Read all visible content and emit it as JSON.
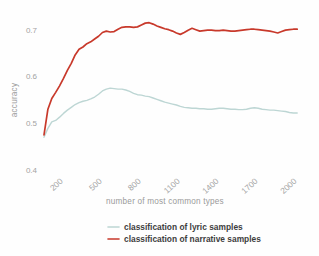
{
  "chart_data": {
    "type": "line",
    "title": "",
    "subtitle": "",
    "xlabel": "number of most common types",
    "ylabel": "accuracy",
    "xlim": [
      50,
      2060
    ],
    "ylim": [
      0.4,
      0.725
    ],
    "grid": false,
    "legend_position": "bottom",
    "xticks": [
      200,
      500,
      800,
      1100,
      1400,
      1700,
      2000
    ],
    "xtick_labels": [
      "200",
      "500",
      "800",
      "1100",
      "1400",
      "1700",
      "2000"
    ],
    "yticks": [
      0.4,
      0.5,
      0.6,
      0.7
    ],
    "ytick_labels": [
      "0.4",
      "0.5",
      "0.6",
      "0.7"
    ],
    "x": [
      50,
      80,
      110,
      140,
      170,
      200,
      230,
      260,
      290,
      320,
      350,
      380,
      410,
      440,
      470,
      500,
      530,
      560,
      590,
      620,
      650,
      680,
      710,
      740,
      770,
      800,
      830,
      860,
      890,
      920,
      950,
      980,
      1010,
      1040,
      1070,
      1100,
      1130,
      1160,
      1190,
      1220,
      1250,
      1280,
      1310,
      1340,
      1370,
      1400,
      1430,
      1460,
      1490,
      1520,
      1550,
      1580,
      1610,
      1640,
      1670,
      1700,
      1730,
      1760,
      1790,
      1820,
      1850,
      1880,
      1910,
      1940,
      1970,
      2000
    ],
    "series": [
      {
        "name": "classification of lyric samples",
        "color": "#bdd6d4",
        "values": [
          0.47,
          0.489,
          0.503,
          0.506,
          0.513,
          0.521,
          0.528,
          0.534,
          0.54,
          0.544,
          0.547,
          0.549,
          0.552,
          0.556,
          0.562,
          0.569,
          0.573,
          0.575,
          0.574,
          0.573,
          0.573,
          0.571,
          0.568,
          0.564,
          0.561,
          0.56,
          0.558,
          0.557,
          0.554,
          0.551,
          0.548,
          0.545,
          0.543,
          0.541,
          0.539,
          0.536,
          0.534,
          0.533,
          0.532,
          0.532,
          0.531,
          0.531,
          0.53,
          0.53,
          0.531,
          0.532,
          0.532,
          0.531,
          0.53,
          0.53,
          0.529,
          0.529,
          0.53,
          0.532,
          0.533,
          0.532,
          0.53,
          0.529,
          0.528,
          0.528,
          0.527,
          0.526,
          0.525,
          0.523,
          0.522,
          0.522
        ]
      },
      {
        "name": "classification of narrative samples",
        "color": "#c8392b",
        "values": [
          0.475,
          0.53,
          0.553,
          0.566,
          0.58,
          0.596,
          0.613,
          0.628,
          0.646,
          0.658,
          0.663,
          0.67,
          0.674,
          0.68,
          0.686,
          0.694,
          0.697,
          0.695,
          0.696,
          0.701,
          0.705,
          0.706,
          0.706,
          0.705,
          0.706,
          0.71,
          0.714,
          0.715,
          0.712,
          0.708,
          0.705,
          0.702,
          0.7,
          0.697,
          0.693,
          0.69,
          0.694,
          0.699,
          0.703,
          0.7,
          0.697,
          0.698,
          0.699,
          0.699,
          0.698,
          0.698,
          0.699,
          0.698,
          0.697,
          0.697,
          0.698,
          0.699,
          0.7,
          0.701,
          0.701,
          0.7,
          0.699,
          0.698,
          0.697,
          0.695,
          0.693,
          0.696,
          0.699,
          0.7,
          0.701,
          0.701
        ]
      }
    ]
  },
  "legend": {
    "items": [
      {
        "label": "classification of lyric samples",
        "color": "#bdd6d4"
      },
      {
        "label": "classification of narrative samples",
        "color": "#c8392b"
      }
    ]
  }
}
